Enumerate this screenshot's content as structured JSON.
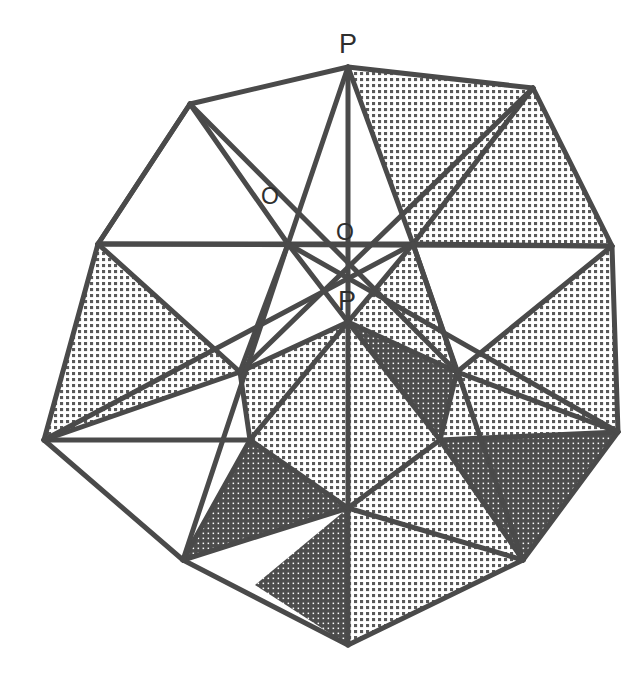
{
  "figure": {
    "background_color": "#ffffff",
    "stroke_color": "#4a4a4a",
    "stroke_width": 5,
    "fill_white": "#ffffff",
    "fill_light_hatch": "#6d6d6d",
    "fill_dark_hatch": "#4e4e4e",
    "center": {
      "x": 348,
      "y": 348
    }
  },
  "labels": [
    {
      "id": "label-p-top",
      "text": "P",
      "x": 339,
      "y": 31,
      "size": "P"
    },
    {
      "id": "label-o-left",
      "text": "O",
      "x": 261,
      "y": 185,
      "size": "O"
    },
    {
      "id": "label-o-right",
      "text": "O",
      "x": 336,
      "y": 221,
      "size": "O"
    },
    {
      "id": "label-p-center",
      "text": "P",
      "x": 338,
      "y": 288,
      "size": "P"
    }
  ],
  "geometry": {
    "outer_points": [
      {
        "name": "tip-top",
        "x": 348,
        "y": 67
      },
      {
        "name": "tip-upper-right",
        "x": 533,
        "y": 88
      },
      {
        "name": "tip-right",
        "x": 612,
        "y": 246
      },
      {
        "name": "tip-lower-right",
        "x": 618,
        "y": 432
      },
      {
        "name": "tip-bottom-right",
        "x": 523,
        "y": 560
      },
      {
        "name": "tip-bottom",
        "x": 348,
        "y": 645
      },
      {
        "name": "tip-bottom-left",
        "x": 183,
        "y": 560
      },
      {
        "name": "tip-lower-left",
        "x": 44,
        "y": 440
      },
      {
        "name": "tip-left",
        "x": 98,
        "y": 244
      },
      {
        "name": "tip-upper-left",
        "x": 190,
        "y": 104
      }
    ],
    "inner_points": [
      {
        "name": "inner-upper-left",
        "x": 288,
        "y": 244
      },
      {
        "name": "inner-upper-right",
        "x": 413,
        "y": 244
      },
      {
        "name": "inner-right",
        "x": 457,
        "y": 372
      },
      {
        "name": "inner-lower-right",
        "x": 440,
        "y": 440
      },
      {
        "name": "inner-bottom",
        "x": 348,
        "y": 508
      },
      {
        "name": "inner-lower-left",
        "x": 250,
        "y": 440
      },
      {
        "name": "inner-left",
        "x": 240,
        "y": 372
      },
      {
        "name": "inner-center-p",
        "x": 348,
        "y": 322
      }
    ],
    "description": "Ten-pointed stellation outline with interior triangular facets rendered in white, light halftone and dark halftone."
  },
  "faces": [
    {
      "id": "f01",
      "tone": "white",
      "pts": "190,104 348,67 288,244"
    },
    {
      "id": "f02",
      "tone": "white",
      "pts": "190,104 288,244 98,244"
    },
    {
      "id": "f03",
      "tone": "white",
      "pts": "348,67 413,244 288,244"
    },
    {
      "id": "f04",
      "tone": "light",
      "pts": "348,67 533,88 413,244"
    },
    {
      "id": "f05",
      "tone": "light",
      "pts": "533,88 612,246 413,244"
    },
    {
      "id": "f06",
      "tone": "white",
      "pts": "98,244 288,244 240,372"
    },
    {
      "id": "f07",
      "tone": "light",
      "pts": "98,244 240,372 44,440"
    },
    {
      "id": "f08",
      "tone": "light",
      "pts": "612,246 457,372 618,432"
    },
    {
      "id": "f09",
      "tone": "white",
      "pts": "413,244 457,372 612,246"
    },
    {
      "id": "f10",
      "tone": "white",
      "pts": "288,244 348,322 240,372"
    },
    {
      "id": "f11",
      "tone": "light",
      "pts": "413,244 348,322 457,372"
    },
    {
      "id": "f12",
      "tone": "light",
      "pts": "240,372 348,322 250,440"
    },
    {
      "id": "f13",
      "tone": "dark",
      "pts": "348,322 457,372 440,440"
    },
    {
      "id": "f14",
      "tone": "light",
      "pts": "348,322 440,440 348,508"
    },
    {
      "id": "f15",
      "tone": "light",
      "pts": "348,322 348,508 250,440"
    },
    {
      "id": "f16",
      "tone": "white",
      "pts": "44,440 240,372 250,440"
    },
    {
      "id": "f17",
      "tone": "white",
      "pts": "250,440 348,508 183,560"
    },
    {
      "id": "f18",
      "tone": "dark",
      "pts": "250,440 183,560 348,508"
    },
    {
      "id": "f19",
      "tone": "light",
      "pts": "457,372 618,432 440,440"
    },
    {
      "id": "f20",
      "tone": "dark",
      "pts": "440,440 618,432 523,560"
    },
    {
      "id": "f21",
      "tone": "light",
      "pts": "440,440 523,560 348,508"
    },
    {
      "id": "f22",
      "tone": "light",
      "pts": "348,508 523,560 348,645"
    },
    {
      "id": "f23",
      "tone": "dark",
      "pts": "348,508 348,645 255,585"
    }
  ]
}
